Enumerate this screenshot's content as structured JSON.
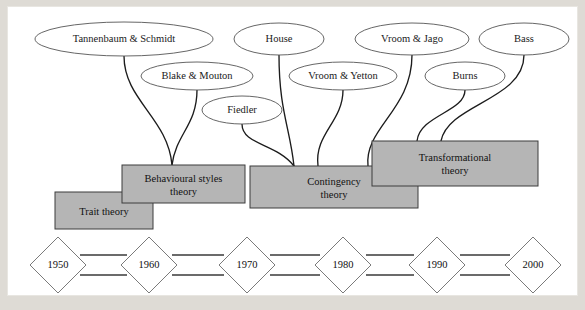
{
  "diagram": {
    "colors": {
      "page_background": "#dedbd5",
      "canvas_background": "#ffffff",
      "box_fill": "#b5b5b5",
      "box_stroke": "#3d3d3d",
      "ellipse_fill": "#ffffff",
      "ellipse_stroke": "#555555",
      "connector_stroke": "#1c1c1c",
      "diamond_stroke": "#6b6b6b",
      "rail_stroke": "#3a3a3a"
    },
    "theorists": [
      {
        "id": "tannenbaum-schmidt",
        "label": "Tannenbaum & Schmidt",
        "cx": 124,
        "cy": 39,
        "rx": 89,
        "ry": 17
      },
      {
        "id": "house",
        "label": "House",
        "cx": 279,
        "cy": 39,
        "rx": 45,
        "ry": 16
      },
      {
        "id": "vroom-jago",
        "label": "Vroom & Jago",
        "cx": 412,
        "cy": 39,
        "rx": 57,
        "ry": 16
      },
      {
        "id": "bass",
        "label": "Bass",
        "cx": 524,
        "cy": 39,
        "rx": 45,
        "ry": 16
      },
      {
        "id": "blake-mouton",
        "label": "Blake & Mouton",
        "cx": 197,
        "cy": 76,
        "rx": 56,
        "ry": 14
      },
      {
        "id": "vroom-yetton",
        "label": "Vroom & Yetton",
        "cx": 343,
        "cy": 76,
        "rx": 54,
        "ry": 14
      },
      {
        "id": "burns",
        "label": "Burns",
        "cx": 465,
        "cy": 76,
        "rx": 40,
        "ry": 14
      },
      {
        "id": "fiedler",
        "label": "Fiedler",
        "cx": 242,
        "cy": 110,
        "rx": 40,
        "ry": 14
      }
    ],
    "theories": [
      {
        "id": "trait-theory",
        "lines": [
          "Trait theory"
        ],
        "x": 55,
        "y": 192,
        "w": 98,
        "h": 37
      },
      {
        "id": "behavioural-styles-theory",
        "lines": [
          "Behavioural styles",
          "theory"
        ],
        "x": 122,
        "y": 165,
        "w": 123,
        "h": 38
      },
      {
        "id": "contingency-theory",
        "lines": [
          "Contingency",
          "theory"
        ],
        "x": 250,
        "y": 166,
        "w": 168,
        "h": 42
      },
      {
        "id": "transformational-theory",
        "lines": [
          "Transformational",
          "theory"
        ],
        "x": 372,
        "y": 141,
        "w": 166,
        "h": 45
      }
    ],
    "connectors": [
      {
        "id": "tannenbaum-schmidt-to-behavioural",
        "from": "tannenbaum-schmidt",
        "to": "behavioural-styles-theory",
        "path": "M 124,56 C 124,100 168,118 172,165"
      },
      {
        "id": "blake-mouton-to-behavioural",
        "from": "blake-mouton",
        "to": "behavioural-styles-theory",
        "path": "M 197,90 C 197,125 176,134 172,165"
      },
      {
        "id": "fiedler-to-contingency",
        "from": "fiedler",
        "to": "contingency-theory",
        "path": "M 242,124 C 242,145 276,143 294,166"
      },
      {
        "id": "house-to-contingency",
        "from": "house",
        "to": "contingency-theory",
        "path": "M 279,55 C 279,110 290,128 294,166"
      },
      {
        "id": "vroom-yetton-to-contingency",
        "from": "vroom-yetton",
        "to": "contingency-theory",
        "path": "M 343,90 C 343,122 314,134 318,166"
      },
      {
        "id": "vroom-jago-to-contingency",
        "from": "vroom-jago",
        "to": "contingency-theory",
        "path": "M 412,55 C 412,110 364,128 368,166"
      },
      {
        "id": "burns-to-transformational",
        "from": "burns",
        "to": "transformational-theory",
        "path": "M 465,90 C 465,112 420,115 417,141"
      },
      {
        "id": "bass-to-transformational",
        "from": "bass",
        "to": "transformational-theory",
        "path": "M 524,55 C 524,100 448,104 441,141"
      }
    ],
    "timeline": {
      "axis_y": 265,
      "decades": [
        {
          "label": "1950",
          "cx": 58
        },
        {
          "label": "1960",
          "cx": 149
        },
        {
          "label": "1970",
          "cx": 247
        },
        {
          "label": "1980",
          "cx": 343
        },
        {
          "label": "1990",
          "cx": 437
        },
        {
          "label": "2000",
          "cx": 533
        }
      ],
      "diamond_rx": 28,
      "diamond_ry": 28,
      "rail_segments": [
        {
          "id": "rail-1950-1960-upper",
          "x1": 80,
          "y": 255,
          "x2": 127
        },
        {
          "id": "rail-1950-1960-lower",
          "x1": 80,
          "y": 275,
          "x2": 127
        },
        {
          "id": "rail-1960-1970-upper",
          "x1": 172,
          "y": 255,
          "x2": 224
        },
        {
          "id": "rail-1960-1970-lower",
          "x1": 172,
          "y": 275,
          "x2": 224
        },
        {
          "id": "rail-1970-1980-upper",
          "x1": 270,
          "y": 255,
          "x2": 320
        },
        {
          "id": "rail-1970-1980-lower",
          "x1": 270,
          "y": 275,
          "x2": 320
        },
        {
          "id": "rail-1980-1990-upper",
          "x1": 366,
          "y": 255,
          "x2": 414
        },
        {
          "id": "rail-1980-1990-lower",
          "x1": 366,
          "y": 275,
          "x2": 414
        },
        {
          "id": "rail-1990-2000-upper",
          "x1": 460,
          "y": 255,
          "x2": 510
        },
        {
          "id": "rail-1990-2000-lower",
          "x1": 460,
          "y": 275,
          "x2": 510
        }
      ]
    }
  }
}
